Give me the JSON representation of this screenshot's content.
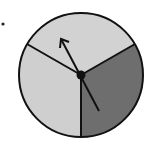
{
  "diagram": {
    "type": "spinner",
    "sectors": [
      {
        "name": "upper",
        "color": "#d2d2d2"
      },
      {
        "name": "lower-left",
        "color": "#cfcfcf"
      },
      {
        "name": "lower-right",
        "color": "#6e6e6e"
      }
    ],
    "outline_color": "#111111",
    "pointer_color": "#111111",
    "marker_dot": true
  }
}
